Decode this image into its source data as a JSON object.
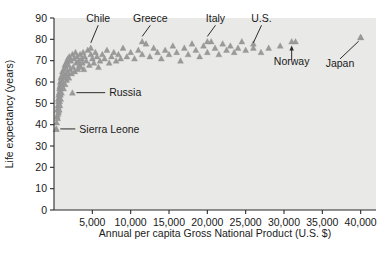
{
  "chart_data": {
    "type": "scatter",
    "title": "",
    "xlabel": "Annual per capita Gross National Product (U.S. $)",
    "ylabel": "Life expectancy (years)",
    "xlim": [
      0,
      42000
    ],
    "ylim": [
      0,
      90
    ],
    "grid": false,
    "legend": "none",
    "marker": "triangle",
    "marker_color": "#9a9a9a",
    "plot_background": "#e9e9e7",
    "xticks": [
      5000,
      10000,
      15000,
      20000,
      25000,
      30000,
      35000,
      40000
    ],
    "xtick_labels": [
      "5,000",
      "10,000",
      "15,000",
      "20,000",
      "25,000",
      "30,000",
      "35,000",
      "40,000"
    ],
    "yticks": [
      0,
      10,
      20,
      30,
      40,
      50,
      60,
      70,
      80,
      90
    ],
    "ytick_labels": [
      "0",
      "10",
      "20",
      "30",
      "40",
      "50",
      "60",
      "70",
      "80",
      "90"
    ],
    "points": [
      [
        300,
        38
      ],
      [
        350,
        41
      ],
      [
        420,
        44
      ],
      [
        450,
        47
      ],
      [
        480,
        43
      ],
      [
        500,
        49
      ],
      [
        520,
        45
      ],
      [
        540,
        52
      ],
      [
        560,
        48
      ],
      [
        580,
        51
      ],
      [
        600,
        46
      ],
      [
        620,
        54
      ],
      [
        650,
        50
      ],
      [
        670,
        55
      ],
      [
        690,
        47
      ],
      [
        700,
        53
      ],
      [
        720,
        57
      ],
      [
        740,
        51
      ],
      [
        760,
        58
      ],
      [
        780,
        49
      ],
      [
        800,
        56
      ],
      [
        820,
        60
      ],
      [
        840,
        54
      ],
      [
        860,
        59
      ],
      [
        880,
        52
      ],
      [
        900,
        62
      ],
      [
        920,
        57
      ],
      [
        950,
        61
      ],
      [
        980,
        55
      ],
      [
        1000,
        63
      ],
      [
        1050,
        58
      ],
      [
        1100,
        65
      ],
      [
        1150,
        60
      ],
      [
        1200,
        64
      ],
      [
        1250,
        57
      ],
      [
        1300,
        66
      ],
      [
        1350,
        62
      ],
      [
        1400,
        68
      ],
      [
        1450,
        59
      ],
      [
        1500,
        67
      ],
      [
        1550,
        63
      ],
      [
        1600,
        69
      ],
      [
        1650,
        61
      ],
      [
        1700,
        70
      ],
      [
        1750,
        65
      ],
      [
        1800,
        71
      ],
      [
        1850,
        64
      ],
      [
        1900,
        68
      ],
      [
        1950,
        62
      ],
      [
        2000,
        72
      ],
      [
        2100,
        66
      ],
      [
        2200,
        70
      ],
      [
        2300,
        64
      ],
      [
        2400,
        73
      ],
      [
        2500,
        67
      ],
      [
        2600,
        71
      ],
      [
        2700,
        65
      ],
      [
        2800,
        74
      ],
      [
        2900,
        69
      ],
      [
        3000,
        72
      ],
      [
        3100,
        66
      ],
      [
        3200,
        70
      ],
      [
        3300,
        68
      ],
      [
        3400,
        73
      ],
      [
        3500,
        67
      ],
      [
        3600,
        71
      ],
      [
        3700,
        69
      ],
      [
        3800,
        74
      ],
      [
        3900,
        66
      ],
      [
        4000,
        72
      ],
      [
        4200,
        70
      ],
      [
        4400,
        75
      ],
      [
        4600,
        68
      ],
      [
        4800,
        73
      ],
      [
        5000,
        71
      ],
      [
        5200,
        69
      ],
      [
        5400,
        74
      ],
      [
        5600,
        72
      ],
      [
        5800,
        67
      ],
      [
        6000,
        70
      ],
      [
        6300,
        73
      ],
      [
        6600,
        71
      ],
      [
        6900,
        75
      ],
      [
        7200,
        69
      ],
      [
        7500,
        72
      ],
      [
        7800,
        74
      ],
      [
        8100,
        70
      ],
      [
        8400,
        73
      ],
      [
        8700,
        71
      ],
      [
        9000,
        76
      ],
      [
        9500,
        72
      ],
      [
        10000,
        74
      ],
      [
        10500,
        71
      ],
      [
        11000,
        75
      ],
      [
        11500,
        73
      ],
      [
        12000,
        78
      ],
      [
        12500,
        72
      ],
      [
        13000,
        76
      ],
      [
        13500,
        74
      ],
      [
        14000,
        71
      ],
      [
        14500,
        75
      ],
      [
        15000,
        73
      ],
      [
        15500,
        77
      ],
      [
        16000,
        74
      ],
      [
        16500,
        70
      ],
      [
        17000,
        76
      ],
      [
        17500,
        73
      ],
      [
        18000,
        78
      ],
      [
        18500,
        75
      ],
      [
        19000,
        72
      ],
      [
        19500,
        77
      ],
      [
        20000,
        74
      ],
      [
        20500,
        79
      ],
      [
        21000,
        76
      ],
      [
        21500,
        73
      ],
      [
        22000,
        78
      ],
      [
        22500,
        75
      ],
      [
        23000,
        77
      ],
      [
        23500,
        74
      ],
      [
        24000,
        76
      ],
      [
        24500,
        79
      ],
      [
        25000,
        75
      ],
      [
        26000,
        78
      ],
      [
        27000,
        74
      ],
      [
        28000,
        76
      ],
      [
        29500,
        77
      ],
      [
        31500,
        79
      ],
      [
        40000,
        81
      ]
    ],
    "annotations": [
      {
        "label": "Chile",
        "x": 4800,
        "y": 76,
        "label_x": 4200,
        "label_y": 88,
        "leader": "down"
      },
      {
        "label": "Greece",
        "x": 11500,
        "y": 79,
        "label_x": 11000,
        "label_y": 88,
        "leader": "down"
      },
      {
        "label": "Italy",
        "x": 20000,
        "y": 79,
        "label_x": 19500,
        "label_y": 88,
        "leader": "down"
      },
      {
        "label": "U.S.",
        "x": 26000,
        "y": 76,
        "label_x": 25500,
        "label_y": 88,
        "leader": "down"
      },
      {
        "label": "Norway",
        "x": 31000,
        "y": 79,
        "label_x": 31000,
        "label_y": 68,
        "leader": "up"
      },
      {
        "label": "Japan",
        "x": 40000,
        "y": 81,
        "label_x": 36000,
        "label_y": 68,
        "leader": "diag-up-right"
      },
      {
        "label": "Russia",
        "x": 2400,
        "y": 55,
        "label_x": 7200,
        "label_y": 55,
        "leader": "left"
      },
      {
        "label": "Sierra Leone",
        "x": 300,
        "y": 38,
        "label_x": 3300,
        "label_y": 38,
        "leader": "left"
      }
    ]
  }
}
